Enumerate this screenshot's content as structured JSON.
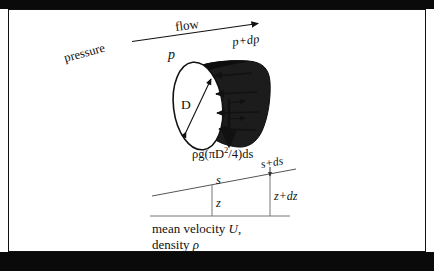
{
  "figure": {
    "frame_color": "#111111",
    "band_color": "#0a0a0a",
    "cylinder_fill": "#1c1c1c",
    "face_fill": "#ffffff"
  },
  "labels": {
    "flow": "flow",
    "pressure": "pressure",
    "p_in": "p",
    "p_out": "p+dp",
    "diameter": "D",
    "weight_prefix": "ρg(πD",
    "weight_exp": "2",
    "weight_suffix": "/4)ds",
    "s": "s",
    "s_ds": "s+ds",
    "z": "z",
    "z_dz": "z+dz",
    "caption_line1_text": "mean velocity ",
    "caption_line1_var": "U",
    "caption_line1_tail": ",",
    "caption_line2_text": "density ",
    "caption_line2_var": "ρ"
  }
}
